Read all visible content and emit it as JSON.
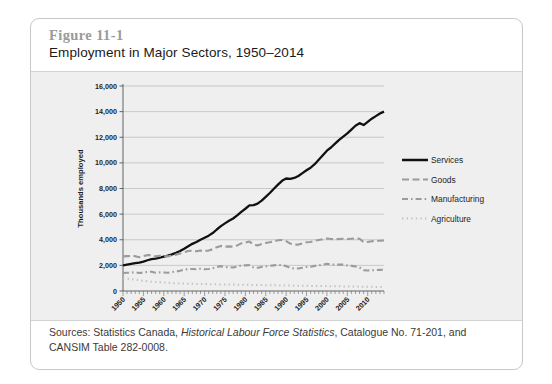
{
  "figure": {
    "number": "Figure 11-1",
    "title": "Employment in Major Sectors, 1950–2014",
    "source_prefix": "Sources: Statistics Canada, ",
    "source_italic": "Historical Labour Force Statistics",
    "source_suffix": ", Catalogue No. 71-201, and CANSIM Table 282-0008."
  },
  "chart_data": {
    "type": "line",
    "title": "Employment in Major Sectors, 1950–2014",
    "xlabel": "",
    "ylabel": "Thousands employed",
    "xlim": [
      1950,
      2014
    ],
    "ylim": [
      0,
      16000
    ],
    "ytick_labels": [
      "16,000",
      "14,000",
      "12,000",
      "10,000",
      "8,000",
      "6,000",
      "4,000",
      "2,000",
      "0"
    ],
    "ytick_values": [
      16000,
      14000,
      12000,
      10000,
      8000,
      6000,
      4000,
      2000,
      0
    ],
    "xtick_labels": [
      "1950",
      "1955",
      "1960",
      "1965",
      "1970",
      "1975",
      "1980",
      "1985",
      "1990",
      "1995",
      "2000",
      "2005",
      "2010"
    ],
    "xtick_values": [
      1950,
      1955,
      1960,
      1965,
      1970,
      1975,
      1980,
      1985,
      1990,
      1995,
      2000,
      2005,
      2010
    ],
    "grid": "horizontal",
    "legend_position": "right",
    "x": [
      1950,
      1951,
      1952,
      1953,
      1954,
      1955,
      1956,
      1957,
      1958,
      1959,
      1960,
      1961,
      1962,
      1963,
      1964,
      1965,
      1966,
      1967,
      1968,
      1969,
      1970,
      1971,
      1972,
      1973,
      1974,
      1975,
      1976,
      1977,
      1978,
      1979,
      1980,
      1981,
      1982,
      1983,
      1984,
      1985,
      1986,
      1987,
      1988,
      1989,
      1990,
      1991,
      1992,
      1993,
      1994,
      1995,
      1996,
      1997,
      1998,
      1999,
      2000,
      2001,
      2002,
      2003,
      2004,
      2005,
      2006,
      2007,
      2008,
      2009,
      2010,
      2011,
      2012,
      2013,
      2014
    ],
    "series": [
      {
        "name": "Services",
        "color": "#111111",
        "style": "solid",
        "values": [
          2000,
          2060,
          2120,
          2180,
          2220,
          2300,
          2400,
          2480,
          2520,
          2600,
          2680,
          2760,
          2860,
          2980,
          3120,
          3300,
          3500,
          3680,
          3820,
          4000,
          4150,
          4320,
          4520,
          4800,
          5060,
          5280,
          5480,
          5660,
          5900,
          6180,
          6420,
          6680,
          6700,
          6820,
          7050,
          7350,
          7650,
          7980,
          8300,
          8600,
          8780,
          8750,
          8820,
          8980,
          9200,
          9420,
          9620,
          9900,
          10250,
          10600,
          10950,
          11200,
          11500,
          11800,
          12050,
          12300,
          12600,
          12900,
          13100,
          12950,
          13200,
          13450,
          13650,
          13850,
          14000
        ]
      },
      {
        "name": "Goods",
        "color": "#9b9b9b",
        "style": "dashed",
        "values": [
          2700,
          2720,
          2740,
          2720,
          2640,
          2720,
          2800,
          2800,
          2700,
          2740,
          2740,
          2700,
          2780,
          2840,
          2920,
          3020,
          3120,
          3140,
          3100,
          3160,
          3120,
          3160,
          3260,
          3420,
          3520,
          3460,
          3480,
          3460,
          3560,
          3720,
          3780,
          3860,
          3620,
          3560,
          3660,
          3740,
          3800,
          3880,
          3960,
          3980,
          3900,
          3700,
          3620,
          3620,
          3720,
          3800,
          3820,
          3920,
          3980,
          4040,
          4100,
          4060,
          4040,
          4060,
          4080,
          4060,
          4080,
          4100,
          4080,
          3820,
          3820,
          3880,
          3900,
          3920,
          3940
        ]
      },
      {
        "name": "Manufacturing",
        "color": "#9b9b9b",
        "style": "dashdot",
        "values": [
          1400,
          1420,
          1440,
          1460,
          1400,
          1440,
          1500,
          1500,
          1420,
          1450,
          1440,
          1420,
          1480,
          1520,
          1580,
          1660,
          1720,
          1720,
          1700,
          1740,
          1700,
          1720,
          1780,
          1880,
          1940,
          1860,
          1860,
          1840,
          1900,
          2000,
          2000,
          2020,
          1840,
          1820,
          1880,
          1920,
          1960,
          2000,
          2040,
          2020,
          1940,
          1800,
          1760,
          1760,
          1820,
          1880,
          1900,
          1960,
          2000,
          2060,
          2120,
          2080,
          2060,
          2060,
          2060,
          2000,
          1960,
          1920,
          1840,
          1620,
          1600,
          1620,
          1640,
          1650,
          1660
        ]
      },
      {
        "name": "Agriculture",
        "color": "#c2c2c2",
        "style": "dotted",
        "values": [
          1000,
          960,
          920,
          880,
          840,
          800,
          760,
          720,
          700,
          680,
          660,
          640,
          620,
          600,
          590,
          580,
          570,
          560,
          550,
          545,
          540,
          530,
          525,
          520,
          515,
          510,
          505,
          500,
          495,
          490,
          485,
          480,
          470,
          465,
          460,
          455,
          450,
          445,
          440,
          435,
          430,
          425,
          420,
          415,
          410,
          405,
          400,
          395,
          390,
          385,
          380,
          375,
          370,
          365,
          360,
          355,
          350,
          345,
          340,
          335,
          330,
          325,
          320,
          315,
          310
        ]
      }
    ]
  }
}
